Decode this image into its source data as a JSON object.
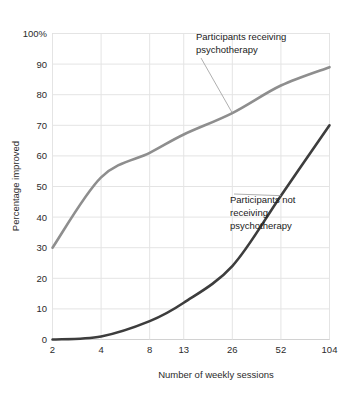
{
  "chart_data": {
    "type": "line",
    "title": "",
    "xlabel": "Number of weekly sessions",
    "ylabel": "Percentage improved",
    "xscale": "log",
    "x": [
      2,
      4,
      8,
      13,
      26,
      52,
      104
    ],
    "xtick_labels": [
      "2",
      "4",
      "8",
      "13",
      "26",
      "52",
      "104"
    ],
    "ytick_labels": [
      "0",
      "10",
      "20",
      "30",
      "40",
      "50",
      "60",
      "70",
      "80",
      "90",
      "100%"
    ],
    "ytick_values": [
      0,
      10,
      20,
      30,
      40,
      50,
      60,
      70,
      80,
      90,
      100
    ],
    "ylim": [
      0,
      100
    ],
    "grid": true,
    "legend": "annotations",
    "series": [
      {
        "name": "Participants receiving psychotherapy",
        "color": "#8e8e8e",
        "values": [
          30,
          53,
          61,
          67,
          74,
          83,
          89
        ]
      },
      {
        "name": "Participants not receiving psychotherapy",
        "color": "#3d3d3d",
        "values": [
          0,
          1,
          6,
          12,
          24,
          47,
          70
        ]
      }
    ],
    "annotations": [
      {
        "id": "annotation-receiving",
        "lines": [
          "Participants receiving",
          "psychotherapy"
        ],
        "anchor_x": 26,
        "anchor_y": 74
      },
      {
        "id": "annotation-not-receiving",
        "lines": [
          "Participants not",
          "receiving",
          "psychotherapy"
        ],
        "anchor_x": 52,
        "anchor_y": 47
      }
    ]
  },
  "axes": {
    "y_title": "Percentage improved",
    "x_title": "Number of weekly sessions",
    "y_ticks": [
      "100%",
      "90",
      "80",
      "70",
      "60",
      "50",
      "40",
      "30",
      "20",
      "10",
      "0"
    ],
    "x_ticks": [
      "2",
      "4",
      "8",
      "13",
      "26",
      "52",
      "104"
    ]
  },
  "annotation_text": {
    "receiving_line1": "Participants receiving",
    "receiving_line2": "psychotherapy",
    "not_receiving_line1": "Participants not",
    "not_receiving_line2": "receiving",
    "not_receiving_line3": "psychotherapy"
  },
  "colors": {
    "background": "#ffffff",
    "grid": "#e4e4e4",
    "frame": "#d2d2d2",
    "series_light": "#8e8e8e",
    "series_dark": "#3d3d3d",
    "text": "#2b2b2b"
  }
}
